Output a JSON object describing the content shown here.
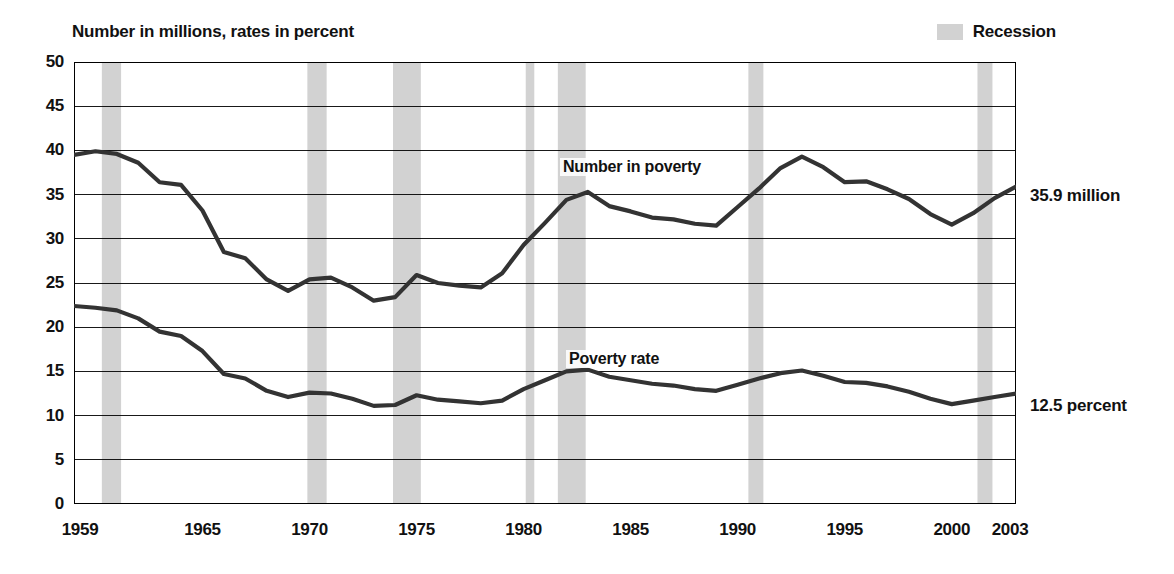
{
  "title": "Number in millions, rates in percent",
  "legend": {
    "recession_label": "Recession",
    "recession_color": "#d2d2d2"
  },
  "annotations": {
    "number_end": "35.9 million",
    "rate_end": "12.5 percent",
    "number_series_label": "Number in poverty",
    "rate_series_label": "Poverty rate"
  },
  "axis": {
    "y_ticks": [
      "0",
      "5",
      "10",
      "15",
      "20",
      "25",
      "30",
      "35",
      "40",
      "45",
      "50"
    ],
    "x_ticks": [
      "1959",
      "1965",
      "1970",
      "1975",
      "1980",
      "1985",
      "1990",
      "1995",
      "2000",
      "2003"
    ]
  },
  "chart_data": {
    "type": "line",
    "title": "Number in millions, rates in percent",
    "xlabel": "",
    "ylabel": "Number in millions, rates in percent",
    "xlim": [
      1959,
      2003
    ],
    "ylim": [
      0,
      50
    ],
    "ytick_step": 5,
    "xtick_step": 1,
    "grid": true,
    "legend_position": "top-right",
    "x": [
      1959,
      1960,
      1961,
      1962,
      1963,
      1964,
      1965,
      1966,
      1967,
      1968,
      1969,
      1970,
      1971,
      1972,
      1973,
      1974,
      1975,
      1976,
      1977,
      1978,
      1979,
      1980,
      1981,
      1982,
      1983,
      1984,
      1985,
      1986,
      1987,
      1988,
      1989,
      1990,
      1991,
      1992,
      1993,
      1994,
      1995,
      1996,
      1997,
      1998,
      1999,
      2000,
      2001,
      2002,
      2003
    ],
    "series": [
      {
        "name": "Number in poverty",
        "units": "millions",
        "color": "#333333",
        "end_value": 35.9,
        "values": [
          39.5,
          39.9,
          39.6,
          38.6,
          36.4,
          36.1,
          33.2,
          28.5,
          27.8,
          25.4,
          24.1,
          25.4,
          25.6,
          24.5,
          23.0,
          23.4,
          25.9,
          25.0,
          24.7,
          24.5,
          26.1,
          29.3,
          31.8,
          34.4,
          35.3,
          33.7,
          33.1,
          32.4,
          32.2,
          31.7,
          31.5,
          33.6,
          35.7,
          38.0,
          39.3,
          38.1,
          36.4,
          36.5,
          35.6,
          34.5,
          32.8,
          31.6,
          32.9,
          34.6,
          35.9
        ]
      },
      {
        "name": "Poverty rate",
        "units": "percent",
        "color": "#333333",
        "end_value": 12.5,
        "values": [
          22.4,
          22.2,
          21.9,
          21.0,
          19.5,
          19.0,
          17.3,
          14.7,
          14.2,
          12.8,
          12.1,
          12.6,
          12.5,
          11.9,
          11.1,
          11.2,
          12.3,
          11.8,
          11.6,
          11.4,
          11.7,
          13.0,
          14.0,
          15.0,
          15.2,
          14.4,
          14.0,
          13.6,
          13.4,
          13.0,
          12.8,
          13.5,
          14.2,
          14.8,
          15.1,
          14.5,
          13.8,
          13.7,
          13.3,
          12.7,
          11.9,
          11.3,
          11.7,
          12.1,
          12.5
        ]
      }
    ],
    "recessions": [
      {
        "start": 1960.3,
        "end": 1961.2
      },
      {
        "start": 1969.9,
        "end": 1970.8
      },
      {
        "start": 1973.9,
        "end": 1975.2
      },
      {
        "start": 1980.1,
        "end": 1980.5
      },
      {
        "start": 1981.6,
        "end": 1982.9
      },
      {
        "start": 1990.5,
        "end": 1991.2
      },
      {
        "start": 2001.2,
        "end": 2001.9
      }
    ]
  }
}
